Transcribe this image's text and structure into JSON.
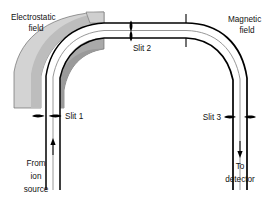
{
  "figure": {
    "width": 279,
    "height": 200,
    "background": "#ffffff"
  },
  "colors": {
    "background": "#ffffff",
    "plate_top_face": "#d3d3d3",
    "plate_front_face": "#a9a9a9",
    "plate_outline": "#6e6e6e",
    "beam_line_dark": "#000000",
    "beam_line_light": "#8c8c8c",
    "text": "#111111",
    "slit_marker": "#000000"
  },
  "labels": {
    "electrostatic_field": {
      "line1": "Electrostatic",
      "line2": "field"
    },
    "magnetic_field": {
      "line1": "Magnetic",
      "line2": "field"
    },
    "slit_1": "Slit 1",
    "slit_2": "Slit 2",
    "slit_3": "Slit 3",
    "from_ion_source": {
      "line1": "From",
      "line2": "ion",
      "line3": "source"
    },
    "to_detector": {
      "line1": "To",
      "line2": "detector"
    }
  },
  "components": {
    "electrostatic_analyzer": {
      "name": "electrostatic-field-sector",
      "description": "Curved pair of shaded deflector plates on the left"
    },
    "magnetic_analyzer": {
      "name": "magnetic-field-sector",
      "description": "Curved beam channel bounded by dark lines on the right"
    },
    "beam_channel": {
      "name": "ion-beam-path",
      "description": "White channel carrying the ion beam from slit 1 through slit 2 to slit 3"
    }
  },
  "flow": {
    "entry": "From ion source",
    "entry_direction": "up",
    "exit": "To detector",
    "exit_direction": "down",
    "slit_sequence": [
      "Slit 1",
      "Slit 2",
      "Slit 3"
    ]
  }
}
